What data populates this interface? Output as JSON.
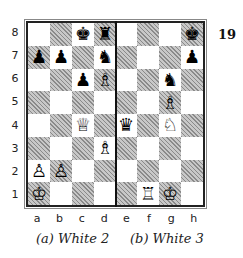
{
  "diagram_number": "19",
  "ranks": [
    "8",
    "7",
    "6",
    "5",
    "4",
    "3",
    "2",
    "1"
  ],
  "files": [
    "a",
    "b",
    "c",
    "d",
    "e",
    "f",
    "g",
    "h"
  ],
  "captions": {
    "left": "(a)  White 2",
    "right": "(b)  White 3"
  },
  "pieces": [
    {
      "square": "c8",
      "color": "black",
      "type": "king",
      "glyph": "♚"
    },
    {
      "square": "d8",
      "color": "black",
      "type": "rook",
      "glyph": "♜"
    },
    {
      "square": "h8",
      "color": "black",
      "type": "king",
      "glyph": "♚"
    },
    {
      "square": "a7",
      "color": "black",
      "type": "pawn",
      "glyph": "♟"
    },
    {
      "square": "b7",
      "color": "black",
      "type": "pawn",
      "glyph": "♟"
    },
    {
      "square": "d7",
      "color": "black",
      "type": "knight",
      "glyph": "♞"
    },
    {
      "square": "h7",
      "color": "black",
      "type": "pawn",
      "glyph": "♟"
    },
    {
      "square": "c6",
      "color": "black",
      "type": "pawn",
      "glyph": "♟"
    },
    {
      "square": "d6",
      "color": "white",
      "type": "bishop",
      "glyph": "♗"
    },
    {
      "square": "g6",
      "color": "black",
      "type": "knight",
      "glyph": "♞"
    },
    {
      "square": "g5",
      "color": "white",
      "type": "bishop",
      "glyph": "♗"
    },
    {
      "square": "c4",
      "color": "white",
      "type": "queen",
      "glyph": "♕"
    },
    {
      "square": "e4",
      "color": "black",
      "type": "queen",
      "glyph": "♛"
    },
    {
      "square": "g4",
      "color": "white",
      "type": "knight",
      "glyph": "♘"
    },
    {
      "square": "d3",
      "color": "white",
      "type": "bishop",
      "glyph": "♗"
    },
    {
      "square": "a2",
      "color": "white",
      "type": "pawn",
      "glyph": "♙"
    },
    {
      "square": "b2",
      "color": "white",
      "type": "pawn",
      "glyph": "♙"
    },
    {
      "square": "a1",
      "color": "white",
      "type": "king",
      "glyph": "♔"
    },
    {
      "square": "f1",
      "color": "white",
      "type": "rook",
      "glyph": "♖"
    },
    {
      "square": "g1",
      "color": "white",
      "type": "king",
      "glyph": "♔"
    }
  ]
}
